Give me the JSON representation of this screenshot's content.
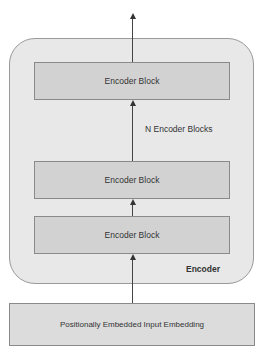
{
  "diagram": {
    "encoder_label": "Encoder",
    "repeat_label": "N Encoder Blocks",
    "blocks": [
      {
        "label": "Encoder Block"
      },
      {
        "label": "Encoder Block"
      },
      {
        "label": "Encoder Block"
      }
    ],
    "input_label": "Positionally Embedded Input Embedding"
  }
}
